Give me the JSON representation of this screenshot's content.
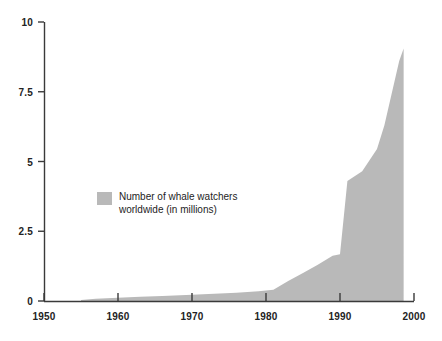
{
  "chart_data": {
    "type": "area",
    "title": "",
    "subtitle": "",
    "xlabel": "",
    "ylabel": "",
    "xlim": [
      1950,
      2000
    ],
    "ylim": [
      0,
      10
    ],
    "grid": false,
    "legend_position": "inside-left-middle",
    "legend_entries": [
      "Number of whale watchers\nworldwide (in millions)"
    ],
    "series": [
      {
        "name": "Number of whale watchers worldwide (in millions)",
        "color": "#b9b9b9",
        "x": [
          1955,
          1957,
          1960,
          1963,
          1966,
          1970,
          1973,
          1976,
          1979,
          1981,
          1983,
          1985,
          1987,
          1989,
          1990,
          1991,
          1993,
          1995,
          1996,
          1998,
          1998.6
        ],
        "values": [
          0.04,
          0.08,
          0.12,
          0.15,
          0.18,
          0.22,
          0.26,
          0.3,
          0.35,
          0.4,
          0.72,
          1.0,
          1.3,
          1.62,
          1.68,
          4.3,
          4.65,
          5.45,
          6.3,
          8.6,
          9.05
        ]
      }
    ],
    "x_ticks": [
      1950,
      1960,
      1970,
      1980,
      1990,
      2000
    ],
    "x_tick_labels": [
      "1950",
      "1960",
      "1970",
      "1980",
      "1990",
      "2000"
    ],
    "y_ticks": [
      0,
      2.5,
      5,
      7.5,
      10
    ],
    "y_tick_labels": [
      "0",
      "2.5",
      "5",
      "7.5",
      "10"
    ],
    "axis_color": "#3a3a3a",
    "background": "#ffffff"
  },
  "legend": {
    "label_line1": "Number of whale watchers",
    "label_line2": "worldwide (in millions)",
    "swatch_color": "#b9b9b9"
  }
}
